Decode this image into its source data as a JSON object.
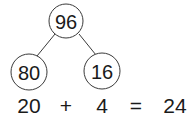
{
  "diagram": {
    "type": "number-bond",
    "root": {
      "value": "96"
    },
    "children": [
      {
        "value": "80"
      },
      {
        "value": "16"
      }
    ]
  },
  "equation": {
    "terms": [
      "20",
      "+",
      "4",
      "=",
      "24"
    ]
  }
}
